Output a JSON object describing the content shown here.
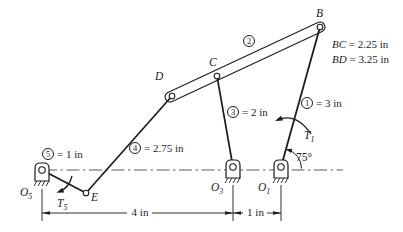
{
  "figure": {
    "background": "#ffffff",
    "line_color": "#1c1c1c"
  },
  "joints": {
    "B": {
      "label": "B"
    },
    "C": {
      "label": "C"
    },
    "D": {
      "label": "D"
    },
    "E": {
      "label": "E"
    }
  },
  "pivots": {
    "o5": {
      "base": "O",
      "sub": "5"
    },
    "o3": {
      "base": "O",
      "sub": "3"
    },
    "o1": {
      "base": "O",
      "sub": "1"
    }
  },
  "links": {
    "l1": {
      "num": "1",
      "value": "= 3 in"
    },
    "l2": {
      "num": "2"
    },
    "l3": {
      "num": "3",
      "value": "= 2 in"
    },
    "l4": {
      "num": "4",
      "value": "= 2.75 in"
    },
    "l5": {
      "num": "5",
      "value": "= 1 in"
    }
  },
  "torques": {
    "t1": {
      "base": "T",
      "sub": "1"
    },
    "t5": {
      "base": "T",
      "sub": "5"
    }
  },
  "angle": {
    "label": "75°"
  },
  "notes": {
    "bc": {
      "var": "BC",
      "value": "= 2.25 in"
    },
    "bd": {
      "var": "BD",
      "value": "= 3.25 in"
    }
  },
  "dimensions": {
    "horizontal_main": "4 in",
    "horizontal_offset": "1 in"
  }
}
